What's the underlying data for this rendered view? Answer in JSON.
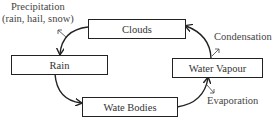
{
  "diagram": {
    "type": "cycle",
    "nodes": [
      {
        "id": "clouds",
        "label": "Clouds"
      },
      {
        "id": "rain",
        "label": "Rain"
      },
      {
        "id": "water_bodies",
        "label": "Wate Bodies"
      },
      {
        "id": "water_vapour",
        "label": "Water Vapour"
      }
    ],
    "edges": [
      {
        "from": "clouds",
        "to": "rain",
        "label": "Precipitation\n(rain, hail, snow)"
      },
      {
        "from": "rain",
        "to": "water_bodies",
        "label": ""
      },
      {
        "from": "water_bodies",
        "to": "water_vapour",
        "label": "Evaporation"
      },
      {
        "from": "water_vapour",
        "to": "clouds",
        "label": "Condensation"
      }
    ],
    "labels": {
      "precipitation_line1": "Precipitation",
      "precipitation_line2": "(rain, hail, snow)",
      "condensation": "Condensation",
      "evaporation": "Evaporation"
    }
  },
  "colors": {
    "stroke": "#222222",
    "text": "#333333",
    "background": "#ffffff"
  }
}
